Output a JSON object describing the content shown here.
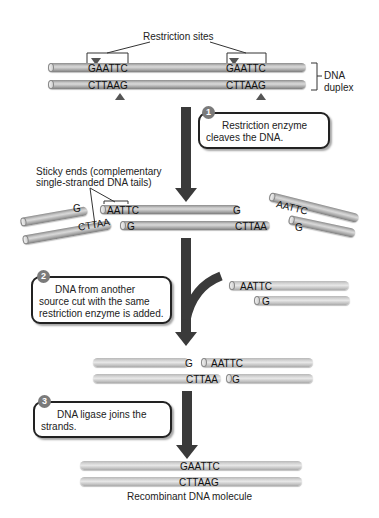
{
  "top": {
    "restriction_sites_label": "Restriction sites",
    "site1_top": "GAATTC",
    "site1_bottom": "CTTAAG",
    "site2_top": "GAATTC",
    "site2_bottom": "CTTAAG",
    "duplex_label_line1": "DNA",
    "duplex_label_line2": "duplex"
  },
  "steps": [
    {
      "number": "1",
      "text_line1": "Restriction enzyme",
      "text_line2": "cleaves the DNA."
    },
    {
      "number": "2",
      "text_line1": "DNA from another",
      "text_line2": "source cut with the same",
      "text_line3": "restriction enzyme is added."
    },
    {
      "number": "3",
      "text_line1": "DNA ligase joins the",
      "text_line2": "strands."
    }
  ],
  "cut": {
    "sticky_label_line1": "Sticky ends (complementary",
    "sticky_label_line2": "single-stranded DNA tails)",
    "left_frag_top": "G",
    "left_frag_bottom": "CTTAA",
    "mid_frag_top_left": "AATTC",
    "mid_frag_top_right": "G",
    "mid_frag_bottom_left": "G",
    "mid_frag_bottom_right": "CTTAA",
    "right_frag_top": "AATTC",
    "right_frag_bottom": "G"
  },
  "foreign": {
    "top": "AATTC",
    "bottom": "G"
  },
  "annealed": {
    "top_left": "G",
    "top_right": "AATTC",
    "bottom_left": "CTTAA",
    "bottom_right": "G"
  },
  "recombinant": {
    "top": "GAATTC",
    "bottom": "CTTAAG",
    "caption": "Recombinant DNA molecule"
  }
}
